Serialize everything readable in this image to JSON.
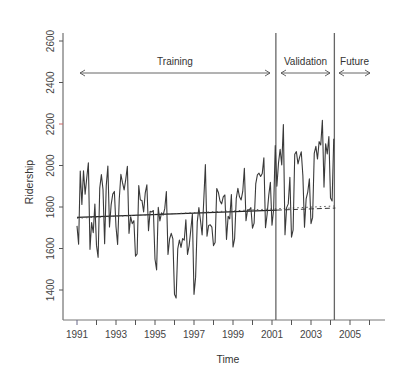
{
  "chart_data": {
    "type": "line",
    "title": "",
    "xlabel": "Time",
    "ylabel": "Ridership",
    "xlim": [
      1990.7,
      2006.6
    ],
    "ylim": [
      1250,
      2650
    ],
    "grid": false,
    "legend": null,
    "x_ticks": [
      1991,
      1992,
      1993,
      1994,
      1995,
      1996,
      1997,
      1998,
      1999,
      2000,
      2001,
      2002,
      2003,
      2004,
      2005,
      2006
    ],
    "x_tick_labels": [
      "1991",
      "1993",
      "1995",
      "1997",
      "1999",
      "2001",
      "2003",
      "2005"
    ],
    "y_ticks": [
      1400,
      1600,
      1800,
      2000,
      2200,
      2400,
      2600
    ],
    "y_tick_labels": [
      "1400",
      "1600",
      "1800",
      "2000",
      "2200",
      "2400",
      "2600"
    ],
    "partitions": [
      {
        "name": "Training",
        "start": 1991.0,
        "end": 2001.25
      },
      {
        "name": "Validation",
        "start": 2001.25,
        "end": 2004.25
      },
      {
        "name": "Future",
        "start": 2004.25,
        "end": 2006.0
      }
    ],
    "partition_lines_x": [
      2001.25,
      2004.25
    ],
    "series": [
      {
        "name": "Ridership",
        "start": 1991.0,
        "frequency": 12,
        "style": "solid",
        "color": "#333333",
        "values": [
          1709,
          1621,
          1973,
          1812,
          1975,
          1862,
          1940,
          2013,
          1596,
          1725,
          1676,
          1814,
          1615,
          1557,
          1891,
          1956,
          1885,
          1623,
          1903,
          1997,
          1704,
          1810,
          1862,
          1875,
          1705,
          1619,
          1837,
          1957,
          1917,
          1882,
          1933,
          1996,
          1673,
          1753,
          1720,
          1734,
          1563,
          1574,
          1903,
          1834,
          1831,
          1776,
          1868,
          1907,
          1686,
          1779,
          1776,
          1783,
          1548,
          1497,
          1798,
          1733,
          1772,
          1761,
          1792,
          1875,
          1571,
          1647,
          1673,
          1646,
          1379,
          1361,
          1598,
          1641,
          1605,
          1648,
          1640,
          1738,
          1571,
          1612,
          1688,
          1766,
          1379,
          1462,
          1727,
          1797,
          1735,
          1665,
          1831,
          2004,
          1659,
          1711,
          1714,
          1703,
          1614,
          1629,
          1889,
          1870,
          1829,
          1815,
          1849,
          1858,
          1644,
          1755,
          1743,
          1860,
          1607,
          1648,
          1840,
          1890,
          1849,
          1834,
          1875,
          1987,
          1734,
          1787,
          1785,
          1797,
          1698,
          1722,
          1911,
          1955,
          1963,
          1947,
          1961,
          2037,
          1700,
          1765,
          1856,
          1919,
          1712,
          1787,
          2096,
          1900,
          2012,
          2078,
          2003,
          2197,
          1666,
          1797,
          1815,
          1943,
          1655,
          1690,
          2054,
          2067,
          2008,
          2040,
          2066,
          1952,
          1703,
          1839,
          1872,
          1936,
          1720,
          1750,
          2058,
          2092,
          2031,
          2115,
          2099,
          2218,
          1896,
          2105,
          2056,
          2140,
          1843,
          1829,
          2129
        ]
      },
      {
        "name": "Linear trend fit (training)",
        "style": "solid",
        "color": "#222222",
        "x": [
          1991.0,
          2001.25
        ],
        "values": [
          1750,
          1785
        ]
      },
      {
        "name": "Trend forecast (validation)",
        "style": "dashed",
        "color": "#333333",
        "x": [
          2001.25,
          2004.25
        ],
        "values": [
          1785,
          1795
        ]
      },
      {
        "name": "Quadratic fit (dotted)",
        "style": "dotted",
        "color": "#555555",
        "x": [
          1991.0,
          2004.25
        ],
        "values": [
          1746,
          1805
        ]
      }
    ]
  }
}
